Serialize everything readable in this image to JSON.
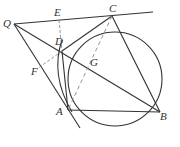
{
  "diagram": {
    "type": "geometry",
    "labels": {
      "Q": "Q",
      "E": "E",
      "C": "C",
      "D": "D",
      "F": "F",
      "G": "G",
      "A": "A",
      "B": "B"
    },
    "colors": {
      "line": "#333333",
      "dashed": "#888888"
    }
  }
}
